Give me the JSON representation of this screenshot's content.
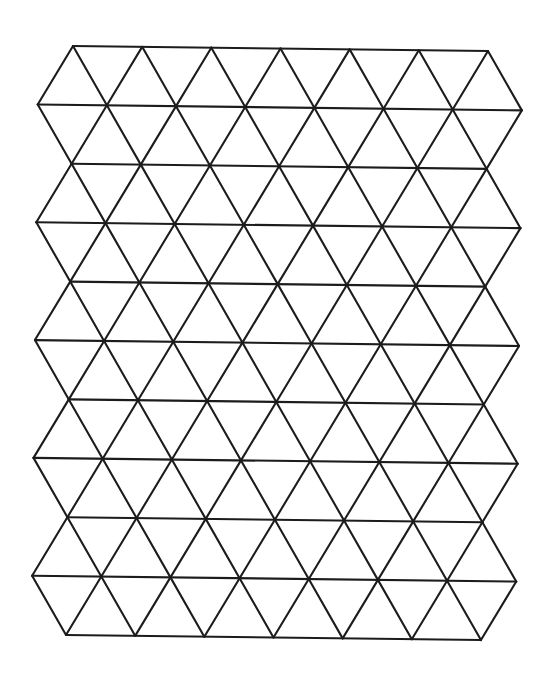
{
  "diagram": {
    "type": "triangular-isometric-grid",
    "rows": 10,
    "horizontal_lines": 11,
    "even_line_vertices": 7,
    "odd_line_vertices": 8,
    "origin": [
      73,
      46
    ],
    "u_step": [
      34.58,
      0.42
    ],
    "v_step": [
      -0.7,
      58.9
    ],
    "even_u_range": [
      0,
      12
    ],
    "odd_u_range": [
      -1,
      13
    ],
    "stroke_color": "#1c1c1c",
    "stroke_width": 2.1,
    "background": "#ffffff"
  }
}
